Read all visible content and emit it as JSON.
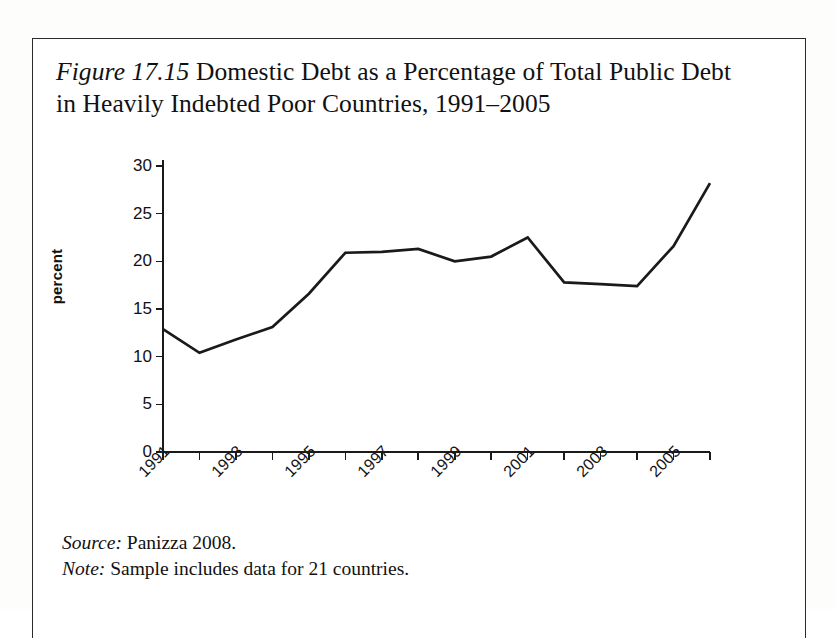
{
  "figure": {
    "number_label": "Figure 17.15",
    "title_text": " Domestic Debt as a Percentage of Total Public Debt in Heavily Indebted Poor Countries, 1991–2005",
    "source_lead": "Source:",
    "source_text": " Panizza 2008.",
    "note_lead": "Note:",
    "note_text": " Sample includes data for 21 countries."
  },
  "colors": {
    "line": "#1a1a1a",
    "axis": "#1a1a1a",
    "text": "#111111",
    "page_background": "#ffffff",
    "border": "#2a2a2a"
  },
  "chart_data": {
    "type": "line",
    "title": "Figure 17.15 Domestic Debt as a Percentage of Total Public Debt in Heavily Indebted Poor Countries, 1991–2005",
    "xlabel": "",
    "ylabel": "percent",
    "ylim": [
      0,
      30
    ],
    "xlim": [
      1991,
      2006
    ],
    "yticks": [
      0,
      5,
      10,
      15,
      20,
      25,
      30
    ],
    "ytick_labels": [
      "0",
      "5",
      "10",
      "15",
      "20",
      "25",
      "30"
    ],
    "xticks": [
      1991,
      1992,
      1993,
      1994,
      1995,
      1996,
      1997,
      1998,
      1999,
      2000,
      2001,
      2002,
      2003,
      2004,
      2005,
      2006
    ],
    "xtick_labels": [
      "1991",
      "",
      "1993",
      "",
      "1995",
      "",
      "1997",
      "",
      "1999",
      "",
      "2001",
      "",
      "2003",
      "",
      "2005",
      ""
    ],
    "grid": false,
    "legend": false,
    "series": [
      {
        "name": "Domestic debt share of total public debt",
        "x": [
          1991,
          1992,
          1993,
          1994,
          1995,
          1996,
          1997,
          1998,
          1999,
          2000,
          2001,
          2002,
          2003,
          2004,
          2005,
          2006
        ],
        "values": [
          12.9,
          10.4,
          11.8,
          13.1,
          16.6,
          20.9,
          21.0,
          21.3,
          20.0,
          20.5,
          22.5,
          17.8,
          17.6,
          17.4,
          21.6,
          28.2
        ]
      }
    ]
  }
}
